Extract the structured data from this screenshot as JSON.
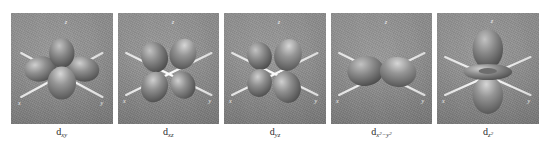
{
  "figure": {
    "title": "",
    "caption": "",
    "panel_count": 5,
    "background_color": "#ffffff",
    "panel_background_color": "#8e8e8e",
    "axis_line_color": "#f0f0f0",
    "lobe_color": "#787878",
    "lobe_highlight_color": "#c8c8c8"
  },
  "panels": [
    {
      "id": "d-xy",
      "label_base": "d",
      "label_sub": "xy",
      "label_text": "dxy",
      "axes": [
        "z",
        "x",
        "y"
      ],
      "axis_labels": {
        "z": "z",
        "x": "x",
        "y": "y"
      },
      "lobe_count": 4,
      "orientation": "four lobes between x and y axes, in the xy plane",
      "has_torus": false
    },
    {
      "id": "d-xz",
      "label_base": "d",
      "label_sub": "xz",
      "label_text": "dxz",
      "axes": [
        "z",
        "x",
        "y"
      ],
      "axis_labels": {
        "z": "z",
        "x": "x",
        "y": "y"
      },
      "lobe_count": 4,
      "orientation": "four lobes between x and z axes, in the xz plane",
      "has_torus": false
    },
    {
      "id": "d-yz",
      "label_base": "d",
      "label_sub": "yz",
      "label_text": "dyz",
      "axes": [
        "z",
        "x",
        "y"
      ],
      "axis_labels": {
        "z": "z",
        "x": "x",
        "y": "y"
      },
      "lobe_count": 4,
      "orientation": "four lobes between y and z axes, in the yz plane",
      "has_torus": false
    },
    {
      "id": "d-x2-y2",
      "label_base": "d",
      "label_sub": "x2-y2",
      "label_text": "dx2-y2",
      "axes": [
        "z",
        "x",
        "y"
      ],
      "axis_labels": {
        "z": "z",
        "x": "x",
        "y": "y"
      },
      "lobe_count": 4,
      "orientation": "four lobes along the x and y axes",
      "has_torus": false
    },
    {
      "id": "d-z2",
      "label_base": "d",
      "label_sub": "z2",
      "label_text": "dz2",
      "axes": [
        "z",
        "x",
        "y"
      ],
      "axis_labels": {
        "z": "z",
        "x": "x",
        "y": "y"
      },
      "lobe_count": 2,
      "orientation": "two lobes along the z axis with a torus in the xy plane",
      "has_torus": true
    }
  ]
}
